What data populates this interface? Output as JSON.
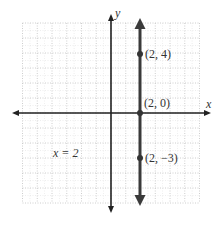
{
  "chart_data": {
    "type": "line",
    "title": "",
    "xlabel": "x",
    "ylabel": "y",
    "xlim": [
      -6,
      6
    ],
    "ylim": [
      -6,
      6
    ],
    "grid": true,
    "grid_style": "dotted",
    "series": [
      {
        "name": "x = 2",
        "equation": "x = 2",
        "kind": "vertical-line",
        "x_constant": 2,
        "arrows": "both",
        "points": [
          {
            "x": 2,
            "y": 4,
            "label": "(2, 4)"
          },
          {
            "x": 2,
            "y": 0,
            "label": "(2, 0)"
          },
          {
            "x": 2,
            "y": -3,
            "label": "(2, −3)"
          }
        ]
      }
    ],
    "annotations": [
      {
        "text": "x = 2",
        "x": -3.8,
        "y": -2.6
      }
    ]
  },
  "labels": {
    "x_axis": "x",
    "y_axis": "y",
    "equation": "x = 2",
    "p1": "(2, 4)",
    "p2": "(2, 0)",
    "p3": "(2, −3)"
  },
  "colors": {
    "grid": "#c8c8c8",
    "axis": "#222222",
    "line": "#3a3a3a",
    "text": "#333333",
    "background": "#ffffff"
  }
}
